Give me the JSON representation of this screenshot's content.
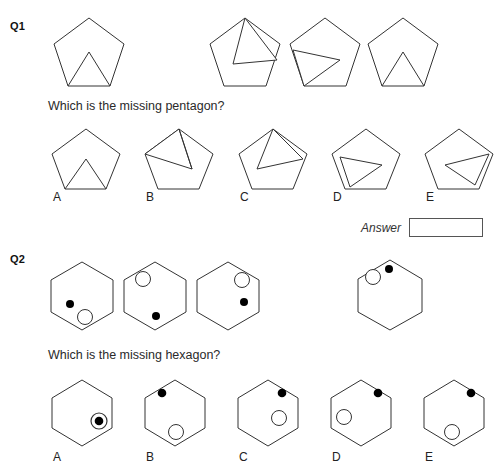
{
  "page": {
    "width": 500,
    "height": 469,
    "background": "#ffffff",
    "stroke_color": "#333333",
    "fill_dot_color": "#000000",
    "open_dot_color": "#ffffff"
  },
  "questions": [
    {
      "id": "q1",
      "label": "Q1",
      "prompt": "Which is the missing pentagon?",
      "shape_type": "pentagon",
      "sequence": [
        {
          "name": "pentagon-sequence-1",
          "inner": "triangle-up-center",
          "description": "pentagon with upward triangle from base"
        },
        {
          "name": "pentagon-sequence-2",
          "inner": "triangle-apex-top",
          "description": "pentagon with triangle from top vertex"
        },
        {
          "name": "pentagon-sequence-3",
          "inner": "triangle-left-arrow",
          "description": "pentagon with leftward triangle"
        },
        {
          "name": "pentagon-sequence-4",
          "inner": "triangle-up-center",
          "description": "pentagon with upward triangle from base"
        }
      ],
      "options": [
        {
          "letter": "A",
          "inner": "triangle-up-center"
        },
        {
          "letter": "B",
          "inner": "triangle-apex-top-wide"
        },
        {
          "letter": "C",
          "inner": "triangle-apex-top"
        },
        {
          "letter": "D",
          "inner": "triangle-right-point"
        },
        {
          "letter": "E",
          "inner": "triangle-left-point"
        }
      ],
      "answer": {
        "label": "Answer",
        "value": "",
        "placeholder": ""
      }
    },
    {
      "id": "q2",
      "label": "Q2",
      "prompt": "Which is the missing hexagon?",
      "shape_type": "hexagon",
      "sequence": [
        {
          "name": "hexagon-sequence-1",
          "marks": [
            {
              "type": "filled",
              "x": 22,
              "y": 44
            },
            {
              "type": "open",
              "x": 37,
              "y": 57
            }
          ]
        },
        {
          "name": "hexagon-sequence-2",
          "marks": [
            {
              "type": "open",
              "x": 22,
              "y": 18
            },
            {
              "type": "filled",
              "x": 35,
              "y": 56
            }
          ]
        },
        {
          "name": "hexagon-sequence-3",
          "marks": [
            {
              "type": "open",
              "x": 48,
              "y": 18
            },
            {
              "type": "filled",
              "x": 50,
              "y": 41
            }
          ]
        },
        {
          "name": "hexagon-sequence-4",
          "marks": [
            {
              "type": "open",
              "x": 18,
              "y": 17
            },
            {
              "type": "filled",
              "x": 34,
              "y": 9
            }
          ]
        }
      ],
      "options": [
        {
          "letter": "A",
          "marks": [
            {
              "type": "concentric",
              "x": 50,
              "y": 42
            }
          ]
        },
        {
          "letter": "B",
          "marks": [
            {
              "type": "filled",
              "x": 21,
              "y": 14
            },
            {
              "type": "open",
              "x": 35,
              "y": 55
            }
          ]
        },
        {
          "letter": "C",
          "marks": [
            {
              "type": "filled",
              "x": 47,
              "y": 14
            },
            {
              "type": "open",
              "x": 44,
              "y": 40
            }
          ]
        },
        {
          "letter": "D",
          "marks": [
            {
              "type": "filled",
              "x": 50,
              "y": 14
            },
            {
              "type": "open",
              "x": 17,
              "y": 40
            }
          ]
        },
        {
          "letter": "E",
          "marks": [
            {
              "type": "filled",
              "x": 50,
              "y": 14
            },
            {
              "type": "open",
              "x": 32,
              "y": 55
            }
          ]
        }
      ]
    }
  ]
}
